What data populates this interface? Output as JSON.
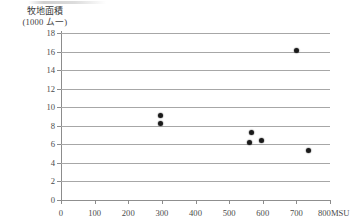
{
  "chart_data": {
    "type": "scatter",
    "title": "",
    "ylabel_lines": [
      "牧地面積",
      "(1000 ム一)"
    ],
    "ylabel": "牧地面積 (1000 ム一)",
    "xlabel": "MSU",
    "xlim": [
      0,
      800
    ],
    "ylim": [
      0,
      18
    ],
    "x_ticks": [
      0,
      100,
      200,
      300,
      400,
      500,
      600,
      700,
      800
    ],
    "x_tick_labels": [
      "0",
      "100",
      "200",
      "300",
      "400",
      "500",
      "600",
      "700",
      "800"
    ],
    "x_unit_suffix": "MSU",
    "y_ticks": [
      0,
      2,
      4,
      6,
      8,
      10,
      12,
      14,
      16,
      18
    ],
    "y_tick_labels": [
      "0",
      "2",
      "4",
      "6",
      "8",
      "10",
      "12",
      "14",
      "16",
      "18"
    ],
    "grid": "horizontal",
    "legend": null,
    "marker": "filled-circle",
    "marker_color": "#1a1a1a",
    "gridline_color": "#a7a7a7",
    "axis_color": "#8c8c8c",
    "points": [
      {
        "x": 297,
        "y": 9.1
      },
      {
        "x": 296,
        "y": 8.2
      },
      {
        "x": 560,
        "y": 6.2
      },
      {
        "x": 568,
        "y": 7.3
      },
      {
        "x": 595,
        "y": 6.4
      },
      {
        "x": 700,
        "y": 16.1
      },
      {
        "x": 735,
        "y": 5.3
      }
    ]
  }
}
